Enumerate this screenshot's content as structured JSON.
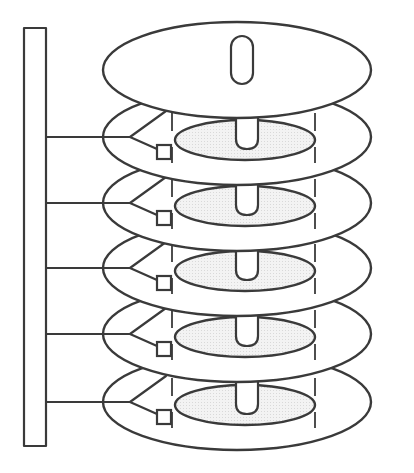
{
  "diagram": {
    "title": "Hard disk platter stack with actuator arms",
    "colors": {
      "stroke": "#3a3a3a",
      "background": "#ffffff",
      "stipple": "#d9d9d9"
    },
    "actuator": {
      "label": "actuator-bar",
      "x": 24,
      "y": 28,
      "width": 22,
      "height": 418
    },
    "top_platter": {
      "label": "top-platter",
      "cx": 237,
      "cy": 70,
      "rx": 134,
      "ry": 48,
      "spindle": {
        "x": 231,
        "y": 36,
        "width": 22,
        "height": 48
      }
    },
    "platters": [
      {
        "label": "platter-1",
        "cy": 137
      },
      {
        "label": "platter-2",
        "cy": 203
      },
      {
        "label": "platter-3",
        "cy": 268
      },
      {
        "label": "platter-4",
        "cy": 334
      },
      {
        "label": "platter-5",
        "cy": 402
      }
    ],
    "platter_shape": {
      "cx": 237,
      "rx": 134,
      "ry": 48
    },
    "inner_cylinder": {
      "cx": 245,
      "dy": 3,
      "rx": 70,
      "ry": 20
    },
    "cylinder_lines": {
      "left_x": 172,
      "right_x": 315
    },
    "head_count": 5
  }
}
